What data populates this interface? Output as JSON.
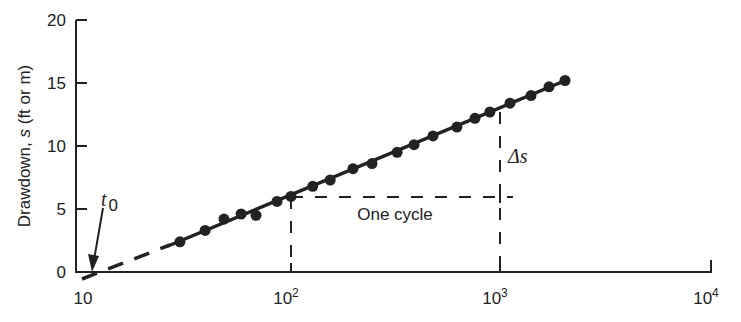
{
  "chart_data": {
    "type": "scatter",
    "title": "",
    "xlabel": "",
    "ylabel": "Drawdown, s (ft or m)",
    "xscale": "log",
    "xlim": [
      10,
      10000
    ],
    "ylim": [
      0,
      20
    ],
    "x_ticks": [
      "10",
      "10^2",
      "10^3",
      "10^4"
    ],
    "y_ticks": [
      "0",
      "5",
      "10",
      "15",
      "20"
    ],
    "grid": false,
    "series": [
      {
        "name": "observed drawdown",
        "marker": "filled-circle",
        "x": [
          29.4,
          38.8,
          47.8,
          57.7,
          68.0,
          85.7,
          100,
          127,
          154,
          198,
          244,
          322,
          388,
          478,
          622,
          759,
          895,
          1116,
          1407,
          1715,
          2046
        ],
        "y": [
          2.4,
          3.3,
          4.2,
          4.6,
          4.5,
          5.6,
          6.0,
          6.8,
          7.3,
          8.2,
          8.6,
          9.5,
          10.1,
          10.8,
          11.5,
          12.2,
          12.7,
          13.4,
          14.0,
          14.7,
          15.2
        ]
      },
      {
        "name": "straight-line fit",
        "style": "solid (dashed extrapolation to t0)",
        "x": [
          11.3,
          2046
        ],
        "y": [
          0,
          15.2
        ]
      }
    ],
    "annotations": [
      {
        "text": "t0",
        "target": [
          11.3,
          0
        ],
        "type": "arrow"
      },
      {
        "text": "One cycle",
        "from_x": 100,
        "to_x": 1000,
        "y": 6.0
      },
      {
        "text": "Δs",
        "x": 1000,
        "from_y": 6.0,
        "to_y": 12.7
      }
    ]
  },
  "labels": {
    "ylabel": "Drawdown, s (ft or m)",
    "ylabel_prefix": "Drawdown, ",
    "ylabel_var": "s",
    "ylabel_suffix": " (ft or m)",
    "y_ticks": [
      "0",
      "5",
      "10",
      "15",
      "20"
    ],
    "x_tick_10": "10",
    "x_tick_base": "10",
    "x_exp_2": "2",
    "x_exp_3": "3",
    "x_exp_4": "4",
    "one_cycle": "One cycle",
    "delta_s": "Δs",
    "t0_t": "t",
    "t0_sub": "0"
  }
}
